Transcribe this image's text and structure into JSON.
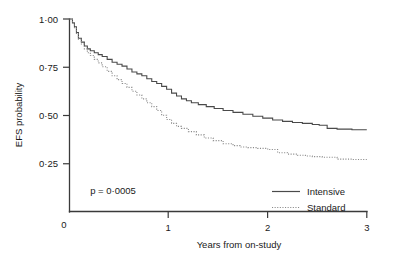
{
  "chart_data": {
    "type": "line",
    "subtype": "kaplan-meier-step",
    "title": "",
    "xlabel": "Years from on-study",
    "ylabel": "EFS probability",
    "xlim": [
      0,
      3
    ],
    "ylim": [
      0,
      1.0
    ],
    "xticks": [
      0,
      1,
      2,
      3
    ],
    "xtick_labels": [
      "0",
      "1",
      "2",
      "3"
    ],
    "yticks": [
      0.25,
      0.5,
      0.75,
      1.0
    ],
    "ytick_labels": [
      "0·25",
      "0·50",
      "0·75",
      "1·00"
    ],
    "grid": false,
    "legend_position": "lower right",
    "annotations": [
      {
        "name": "p-value",
        "text": "p = 0·0005",
        "x": 0.45,
        "y": 0.17
      }
    ],
    "series": [
      {
        "name": "Intensive",
        "style": "solid",
        "color": "#4a4a4a",
        "x": [
          0.0,
          0.03,
          0.05,
          0.07,
          0.09,
          0.12,
          0.15,
          0.18,
          0.21,
          0.25,
          0.29,
          0.33,
          0.38,
          0.43,
          0.48,
          0.53,
          0.58,
          0.63,
          0.68,
          0.73,
          0.78,
          0.83,
          0.88,
          0.93,
          0.98,
          1.03,
          1.08,
          1.13,
          1.18,
          1.23,
          1.3,
          1.38,
          1.46,
          1.55,
          1.65,
          1.75,
          1.85,
          1.95,
          2.05,
          2.15,
          2.25,
          2.35,
          2.45,
          2.52,
          2.6,
          2.7,
          2.85,
          3.0
        ],
        "y": [
          1.0,
          0.98,
          0.96,
          0.93,
          0.9,
          0.88,
          0.86,
          0.845,
          0.835,
          0.825,
          0.815,
          0.805,
          0.79,
          0.775,
          0.765,
          0.755,
          0.74,
          0.725,
          0.715,
          0.705,
          0.69,
          0.675,
          0.665,
          0.65,
          0.635,
          0.615,
          0.6,
          0.585,
          0.575,
          0.565,
          0.555,
          0.545,
          0.535,
          0.525,
          0.515,
          0.505,
          0.495,
          0.485,
          0.475,
          0.468,
          0.462,
          0.458,
          0.452,
          0.448,
          0.432,
          0.428,
          0.425,
          0.425
        ]
      },
      {
        "name": "Standard",
        "style": "dotted",
        "color": "#8a8a8a",
        "x": [
          0.0,
          0.03,
          0.05,
          0.07,
          0.09,
          0.12,
          0.15,
          0.18,
          0.21,
          0.25,
          0.29,
          0.33,
          0.38,
          0.43,
          0.48,
          0.53,
          0.58,
          0.63,
          0.68,
          0.73,
          0.78,
          0.83,
          0.88,
          0.93,
          0.98,
          1.03,
          1.08,
          1.13,
          1.2,
          1.28,
          1.36,
          1.45,
          1.55,
          1.65,
          1.72,
          1.8,
          1.9,
          2.0,
          2.1,
          2.2,
          2.3,
          2.38,
          2.45,
          2.55,
          2.7,
          2.85,
          3.0
        ],
        "y": [
          1.0,
          0.98,
          0.955,
          0.925,
          0.895,
          0.87,
          0.845,
          0.825,
          0.81,
          0.79,
          0.772,
          0.752,
          0.728,
          0.705,
          0.685,
          0.665,
          0.645,
          0.625,
          0.605,
          0.585,
          0.565,
          0.545,
          0.525,
          0.5,
          0.478,
          0.458,
          0.442,
          0.432,
          0.415,
          0.398,
          0.382,
          0.368,
          0.352,
          0.342,
          0.335,
          0.332,
          0.328,
          0.322,
          0.305,
          0.298,
          0.292,
          0.288,
          0.285,
          0.282,
          0.272,
          0.27,
          0.27
        ]
      }
    ]
  },
  "legend": {
    "items": [
      {
        "label": "Intensive",
        "style": "solid"
      },
      {
        "label": "Standard",
        "style": "dotted"
      }
    ]
  }
}
